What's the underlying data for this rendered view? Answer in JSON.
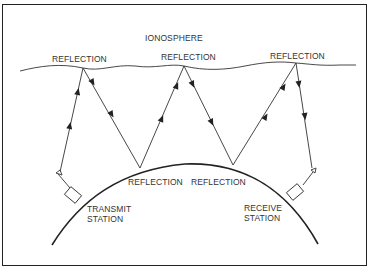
{
  "diagram": {
    "type": "skywave-propagation",
    "labels": {
      "ionosphere": "IONOSPHERE",
      "reflection_top_1": "REFLECTION",
      "reflection_top_2": "REFLECTION",
      "reflection_top_3": "REFLECTION",
      "reflection_ground_1": "REFLECTION",
      "reflection_ground_2": "REFLECTION",
      "transmit_line1": "TRANSMIT",
      "transmit_line2": "STATION",
      "receive_line1": "RECEIVE",
      "receive_line2": "STATION"
    },
    "colors": {
      "line": "#333333",
      "background": "#ffffff"
    }
  }
}
